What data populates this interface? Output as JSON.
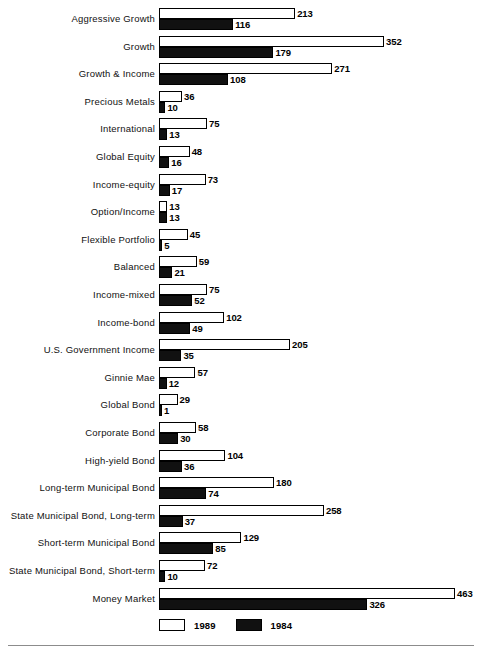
{
  "chart_data": {
    "type": "bar",
    "orientation": "horizontal",
    "title": "",
    "subtitle": "",
    "xlabel": "",
    "ylabel": "",
    "xlim": [
      0,
      463
    ],
    "grid": false,
    "legend_position": "bottom-left",
    "categories": [
      "Aggressive Growth",
      "Growth",
      "Growth & Income",
      "Precious Metals",
      "International",
      "Global Equity",
      "Income-equity",
      "Option/Income",
      "Flexible Portfolio",
      "Balanced",
      "Income-mixed",
      "Income-bond",
      "U.S. Government Income",
      "Ginnie Mae",
      "Global Bond",
      "Corporate Bond",
      "High-yield Bond",
      "Long-term Municipal Bond",
      "State Municipal Bond, Long-term",
      "Short-term Municipal Bond",
      "State Municipal Bond, Short-term",
      "Money Market"
    ],
    "series": [
      {
        "name": "1989",
        "color": "#ffffff",
        "values": [
          213,
          352,
          271,
          36,
          75,
          48,
          73,
          13,
          45,
          59,
          75,
          102,
          205,
          57,
          29,
          58,
          104,
          180,
          258,
          129,
          72,
          463
        ]
      },
      {
        "name": "1984",
        "color": "#111111",
        "values": [
          116,
          179,
          108,
          10,
          13,
          16,
          17,
          13,
          5,
          21,
          52,
          49,
          35,
          12,
          1,
          30,
          36,
          74,
          37,
          85,
          10,
          326
        ]
      }
    ]
  },
  "legend": {
    "items": [
      {
        "label": "1989",
        "swatch": "light"
      },
      {
        "label": "1984",
        "swatch": "dark"
      }
    ]
  }
}
